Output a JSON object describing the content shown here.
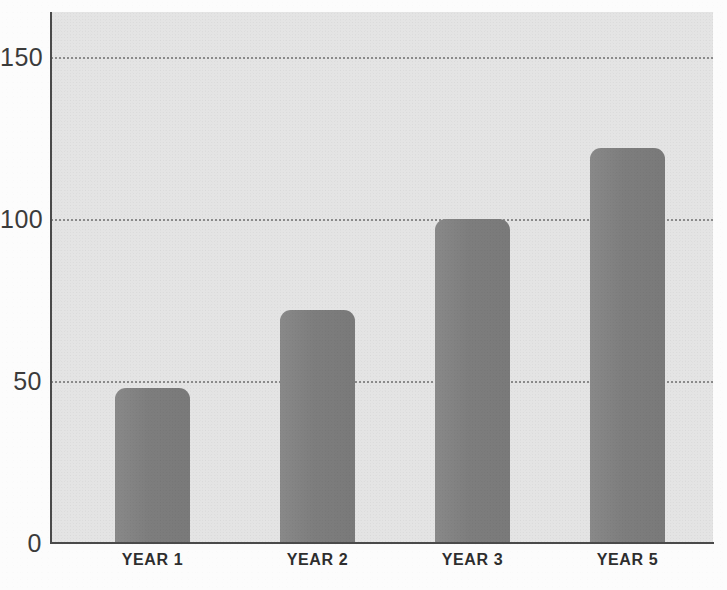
{
  "chart_data": {
    "type": "bar",
    "title": "",
    "subtitle": "",
    "xlabel": "",
    "ylabel": "",
    "categories": [
      "YEAR 1",
      "YEAR 2",
      "YEAR 3",
      "YEAR 5"
    ],
    "values": [
      48,
      72,
      100,
      122
    ],
    "series": [
      {
        "name": "",
        "values": [
          48,
          72,
          100,
          122
        ]
      }
    ],
    "ylim": [
      0,
      164
    ],
    "yticks": [
      0,
      50,
      100,
      150
    ],
    "ytick_labels": [
      "0",
      "50",
      "100",
      "150"
    ],
    "gridlines": [
      50,
      100,
      150
    ],
    "grid": true,
    "grid_style": "dotted",
    "legend": null,
    "legend_position": "none",
    "annotations": []
  },
  "style": {
    "bar_color": "#808080",
    "plot_background": "#e4e4e4",
    "page_background": "#fcfcfc",
    "axis_color": "#4a4a4a",
    "gridline_color": "#6e6e6e",
    "tick_label_color": "#3b3b3b",
    "category_label_color": "#2e2e2e"
  },
  "geometry": {
    "plot_left": 51,
    "plot_top": 12,
    "plot_width": 662,
    "plot_height": 531,
    "baseline_y": 543,
    "pixels_per_unit": 3.24,
    "bar_width": 75,
    "bar_lefts": [
      115,
      280,
      435,
      590
    ]
  }
}
